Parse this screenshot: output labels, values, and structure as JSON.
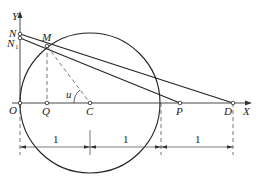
{
  "diagram": {
    "axes": {
      "x_label": "X",
      "y_label": "Y",
      "origin_label": "O"
    },
    "points": {
      "N": "N",
      "N1": "N",
      "N1_sub": "1",
      "M": "M",
      "Q": "Q",
      "C": "C",
      "P": "P",
      "D": "D"
    },
    "angle_label": "u",
    "dimensions": [
      "1",
      "1",
      "1"
    ]
  }
}
